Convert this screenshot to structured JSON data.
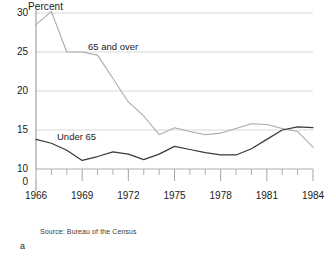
{
  "chart_data": {
    "type": "line",
    "title": "",
    "xlabel": "",
    "ylabel": "Percent",
    "xlim": [
      1966,
      1984
    ],
    "ylim": [
      10,
      30
    ],
    "grid": true,
    "axis_break": true,
    "zero_tick": "0",
    "legend_position": "inline-labels",
    "x": [
      1966,
      1967,
      1968,
      1969,
      1970,
      1971,
      1972,
      1973,
      1974,
      1975,
      1976,
      1977,
      1978,
      1979,
      1980,
      1981,
      1982,
      1983,
      1984
    ],
    "categories": [
      "1966",
      "1967",
      "1968",
      "1969",
      "1970",
      "1971",
      "1972",
      "1973",
      "1974",
      "1975",
      "1976",
      "1977",
      "1978",
      "1979",
      "1980",
      "1981",
      "1982",
      "1983",
      "1984"
    ],
    "series": [
      {
        "name": "65 and over",
        "color": "#a9a9a9",
        "values": [
          28.5,
          30.2,
          25.0,
          25.0,
          24.6,
          21.6,
          18.6,
          16.8,
          14.4,
          15.3,
          14.8,
          14.4,
          14.6,
          15.2,
          15.8,
          15.7,
          15.2,
          14.8,
          12.8
        ]
      },
      {
        "name": "Under 65",
        "color": "#3a3a3a",
        "values": [
          13.8,
          13.3,
          12.4,
          11.1,
          11.6,
          12.2,
          11.9,
          11.2,
          11.9,
          12.9,
          12.5,
          12.1,
          11.8,
          11.8,
          12.6,
          13.8,
          15.0,
          15.4,
          15.3
        ]
      }
    ],
    "ytick_values": [
      30,
      25,
      20,
      15,
      10
    ],
    "ytick_labels": [
      "30",
      "25",
      "20",
      "15",
      "10"
    ],
    "xtick_major": [
      1966,
      1969,
      1972,
      1975,
      1978,
      1981,
      1984
    ],
    "xtick_major_labels": [
      "1966",
      "1969",
      "1972",
      "1975",
      "1978",
      "1981",
      "1984"
    ],
    "annotations": {
      "series_label_high": "65 and over",
      "series_label_low": "Under 65"
    }
  },
  "notes": {
    "source": "Source: Bureau of the Census",
    "figure_label": "a"
  }
}
